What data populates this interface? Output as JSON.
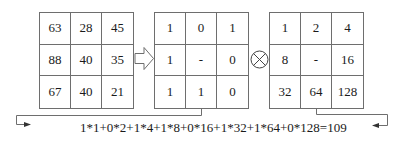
{
  "diagram": {
    "pixel_grid": {
      "label": "neighborhood intensities",
      "cells": [
        "63",
        "28",
        "45",
        "88",
        "40",
        "35",
        "67",
        "40",
        "21"
      ]
    },
    "binary_grid": {
      "label": "thresholded binary pattern",
      "cells": [
        "1",
        "0",
        "1",
        "1",
        "-",
        "0",
        "1",
        "1",
        "0"
      ]
    },
    "weight_grid": {
      "label": "binary weights",
      "cells": [
        "1",
        "2",
        "4",
        "8",
        "-",
        "16",
        "32",
        "64",
        "128"
      ]
    },
    "operators": {
      "transform_arrow": "hollow-right-arrow",
      "multiply_symbol": "circled-times"
    },
    "formula": "1*1+0*2+1*4+1*8+0*16+1*32+1*64+0*128=109",
    "result": "109",
    "colors": {
      "line": "#6e6e6e",
      "text": "#1a1a1a",
      "background": "#ffffff"
    }
  }
}
